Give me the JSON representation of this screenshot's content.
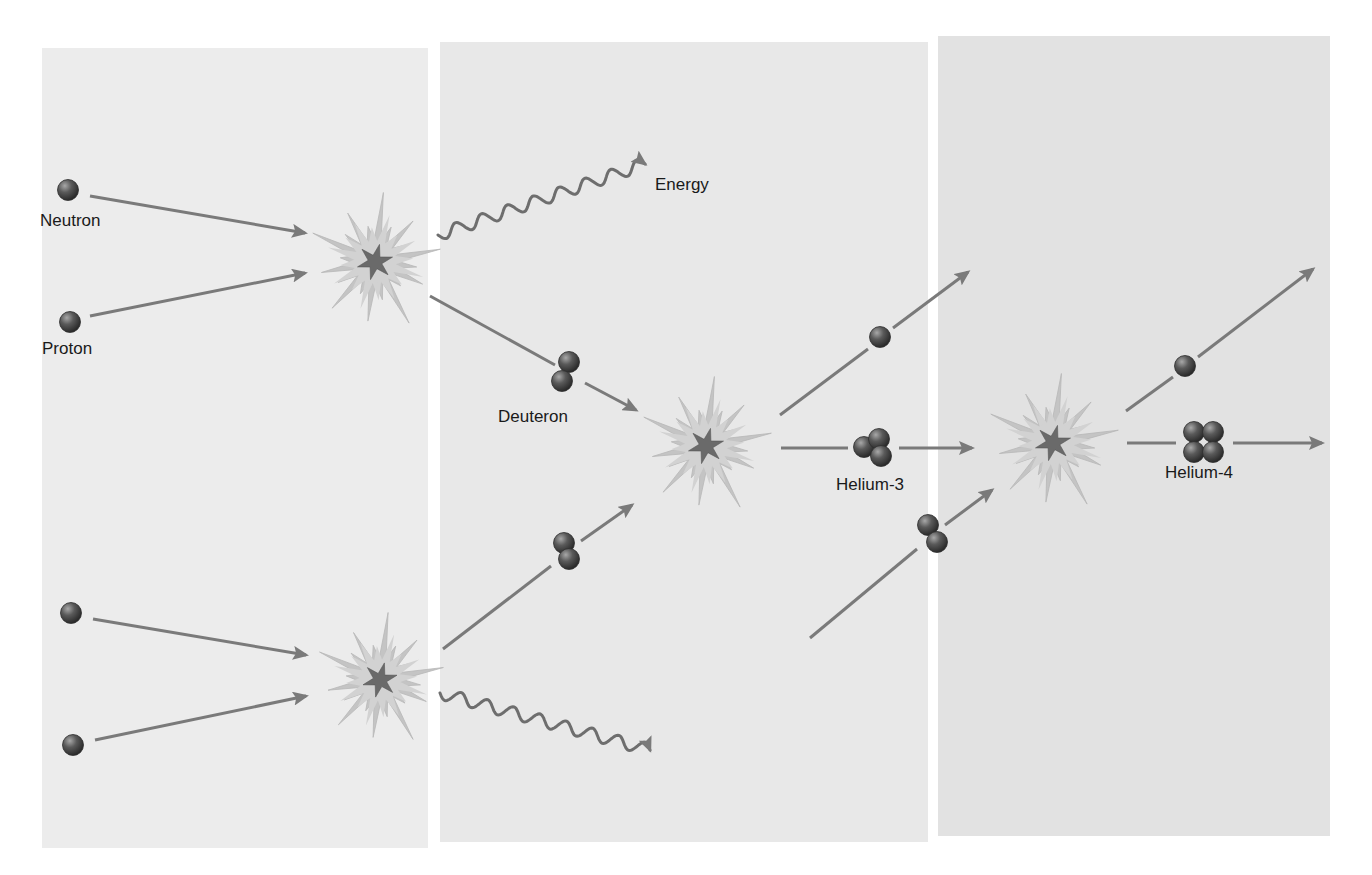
{
  "diagram": {
    "colors": {
      "background": "#ffffff",
      "panel_1": "#ececec",
      "panel_2": "#e8e8e8",
      "panel_3": "#e2e2e2",
      "arrow": "#7a7a7a",
      "particle": "#4a4a4a",
      "particle_highlight": "#9a9a9a",
      "burst_outer": "#c4c4c4",
      "burst_inner": "#d2d2d2",
      "burst_core": "#6a6a6a",
      "text": "#1a1a1a"
    },
    "panels": [
      {
        "name": "stage-1",
        "x": 42,
        "y": 48,
        "w": 386,
        "h": 800
      },
      {
        "name": "stage-2",
        "x": 440,
        "y": 42,
        "w": 488,
        "h": 800
      },
      {
        "name": "stage-3",
        "x": 938,
        "y": 36,
        "w": 392,
        "h": 800
      }
    ],
    "labels": {
      "neutron": {
        "text": "Neutron",
        "x": 40,
        "y": 226
      },
      "proton": {
        "text": "Proton",
        "x": 42,
        "y": 354
      },
      "energy": {
        "text": "Energy",
        "x": 655,
        "y": 190
      },
      "deuteron": {
        "text": "Deuteron",
        "x": 498,
        "y": 422
      },
      "helium3": {
        "text": "Helium-3",
        "x": 836,
        "y": 490
      },
      "helium4": {
        "text": "Helium-4",
        "x": 1165,
        "y": 478
      }
    },
    "collisions": [
      {
        "name": "collision-top",
        "cx": 375,
        "cy": 262,
        "r": 70
      },
      {
        "name": "collision-bottom",
        "cx": 380,
        "cy": 680,
        "r": 68
      },
      {
        "name": "collision-middle",
        "cx": 706,
        "cy": 446,
        "r": 70
      },
      {
        "name": "collision-right",
        "cx": 1053,
        "cy": 443,
        "r": 70
      }
    ],
    "particles": {
      "single": [
        {
          "name": "neutron-top",
          "cx": 68,
          "cy": 190
        },
        {
          "name": "proton-top",
          "cx": 70,
          "cy": 322
        },
        {
          "name": "neutron-bottom",
          "cx": 71,
          "cy": 613
        },
        {
          "name": "proton-bottom",
          "cx": 73,
          "cy": 745
        },
        {
          "name": "released-particle-middle",
          "cx": 880,
          "cy": 337
        },
        {
          "name": "released-particle-right",
          "cx": 1185,
          "cy": 366
        }
      ]
    },
    "nuclei": {
      "deuteron_top": {
        "name": "deuteron-top",
        "spheres": [
          [
            569,
            362
          ],
          [
            562,
            381
          ]
        ]
      },
      "deuteron_bottom": {
        "name": "deuteron-bottom",
        "spheres": [
          [
            564,
            543
          ],
          [
            569,
            559
          ]
        ]
      },
      "deuteron_incoming": {
        "name": "deuteron-incoming",
        "spheres": [
          [
            928,
            525
          ],
          [
            937,
            542
          ]
        ]
      },
      "helium3": {
        "name": "helium-3-nucleus",
        "spheres": [
          [
            864,
            447
          ],
          [
            879,
            439
          ],
          [
            881,
            456
          ]
        ]
      },
      "helium4": {
        "name": "helium-4-nucleus",
        "spheres": [
          [
            1194,
            432
          ],
          [
            1213,
            432
          ],
          [
            1194,
            452
          ],
          [
            1213,
            452
          ]
        ]
      }
    },
    "arrows": [
      {
        "name": "neutron-to-collision-top",
        "x1": 90,
        "y1": 196,
        "x2": 305,
        "y2": 233,
        "head": true
      },
      {
        "name": "proton-to-collision-top",
        "x1": 90,
        "y1": 316,
        "x2": 305,
        "y2": 273,
        "head": true
      },
      {
        "name": "collision-top-to-deuteron",
        "x1": 430,
        "y1": 296,
        "x2": 555,
        "y2": 365,
        "head": false
      },
      {
        "name": "deuteron-to-collision-middle",
        "x1": 585,
        "y1": 383,
        "x2": 636,
        "y2": 410,
        "head": true
      },
      {
        "name": "neutron-bottom-to-collision",
        "x1": 93,
        "y1": 619,
        "x2": 306,
        "y2": 655,
        "head": true
      },
      {
        "name": "proton-bottom-to-collision",
        "x1": 95,
        "y1": 740,
        "x2": 306,
        "y2": 696,
        "head": true
      },
      {
        "name": "collision-bottom-to-deuteron",
        "x1": 443,
        "y1": 649,
        "x2": 551,
        "y2": 566,
        "head": false
      },
      {
        "name": "deuteron-bottom-to-collision-middle",
        "x1": 581,
        "y1": 541,
        "x2": 632,
        "y2": 505,
        "head": true
      },
      {
        "name": "collision-middle-to-particle",
        "x1": 780,
        "y1": 415,
        "x2": 868,
        "y2": 349,
        "head": false
      },
      {
        "name": "particle-to-exit-middle",
        "x1": 893,
        "y1": 328,
        "x2": 968,
        "y2": 272,
        "head": true
      },
      {
        "name": "collision-middle-to-helium3",
        "x1": 781,
        "y1": 448,
        "x2": 848,
        "y2": 448,
        "head": false
      },
      {
        "name": "helium3-to-collision-right",
        "x1": 899,
        "y1": 448,
        "x2": 972,
        "y2": 448,
        "head": true
      },
      {
        "name": "incoming-to-deuteron",
        "x1": 810,
        "y1": 638,
        "x2": 917,
        "y2": 549,
        "head": false
      },
      {
        "name": "deuteron-to-collision-right",
        "x1": 945,
        "y1": 525,
        "x2": 992,
        "y2": 490,
        "head": true
      },
      {
        "name": "collision-right-to-particle",
        "x1": 1126,
        "y1": 411,
        "x2": 1173,
        "y2": 377,
        "head": false
      },
      {
        "name": "particle-to-exit-right",
        "x1": 1198,
        "y1": 357,
        "x2": 1313,
        "y2": 269,
        "head": true
      },
      {
        "name": "collision-right-to-helium4",
        "x1": 1127,
        "y1": 443,
        "x2": 1176,
        "y2": 443,
        "head": false
      },
      {
        "name": "helium4-to-exit",
        "x1": 1233,
        "y1": 443,
        "x2": 1322,
        "y2": 443,
        "head": true
      }
    ],
    "waves": [
      {
        "name": "energy-wave-top",
        "x1": 438,
        "y1": 235,
        "x2": 645,
        "y2": 164
      },
      {
        "name": "energy-wave-bottom",
        "x1": 440,
        "y1": 693,
        "x2": 650,
        "y2": 750
      }
    ]
  }
}
